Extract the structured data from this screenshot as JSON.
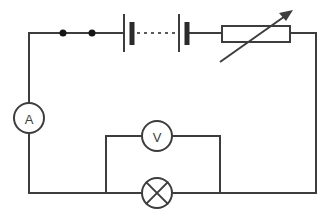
{
  "diagram": {
    "type": "electrical-circuit-schematic",
    "background_color": "#ffffff",
    "line_color": "#3d3d3d",
    "width": 328,
    "height": 221
  },
  "components": {
    "ammeter": {
      "symbol_label": "A",
      "name": "ammeter",
      "position": {
        "cx": 29,
        "cy": 118,
        "r": 15
      }
    },
    "voltmeter": {
      "symbol_label": "V",
      "name": "voltmeter",
      "position": {
        "cx": 157,
        "cy": 136,
        "r": 15
      }
    },
    "lamp": {
      "symbol_label": "",
      "name": "lamp",
      "position": {
        "cx": 157,
        "cy": 193,
        "r": 15
      }
    },
    "battery": {
      "name": "battery-two-cells",
      "cell_count": 2,
      "cells": [
        {
          "long_plate_x": 124,
          "short_plate_x": 131
        },
        {
          "long_plate_x": 180,
          "short_plate_x": 186
        }
      ],
      "link_style": "dashed"
    },
    "rheostat": {
      "name": "variable-resistor",
      "box": {
        "x": 222,
        "y": 26,
        "width": 68,
        "height": 16
      },
      "arrow": {
        "x1": 220,
        "y1": 62,
        "x2": 292,
        "y2": 11
      }
    },
    "junction_dots": [
      {
        "cx": 63,
        "cy": 33,
        "r": 3.5
      },
      {
        "cx": 92,
        "cy": 33,
        "r": 3.5
      }
    ]
  },
  "icons": {
    "ammeter": "ammeter-circle-icon",
    "voltmeter": "voltmeter-circle-icon",
    "lamp": "lamp-cross-circle-icon",
    "battery": "battery-cell-icon",
    "rheostat": "variable-resistor-icon",
    "arrow": "diagonal-arrow-icon"
  }
}
